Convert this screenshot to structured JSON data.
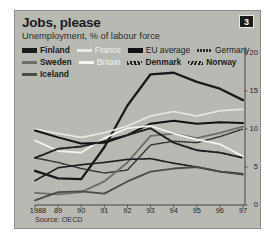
{
  "figure": {
    "title": "Jobs, please",
    "subtitle": "Unemployment, % of labour force",
    "badge": "3",
    "source": "Source: OECD",
    "panel_color": "#b9b9b4"
  },
  "legend": {
    "rows": [
      [
        {
          "label": "Finland",
          "style": "solid-thick-dark",
          "color": "#1a1a1a",
          "bold": true
        },
        {
          "label": "France",
          "style": "solid-light",
          "color": "#e9e9e4",
          "bold": false
        },
        {
          "label": "EU average",
          "style": "solid-thick-black",
          "color": "#111111",
          "bold": false
        },
        {
          "label": "Germany",
          "style": "dotted-dark",
          "color": "#2e2e2e",
          "bold": false
        }
      ],
      [
        {
          "label": "Sweden",
          "style": "solid-medium-grey",
          "color": "#6e6e68",
          "bold": true
        },
        {
          "label": "Britain",
          "style": "solid-white",
          "color": "#f4f4f1",
          "bold": false
        },
        {
          "label": "Denmark",
          "style": "dashed-slash-dark",
          "color": "#1f1f1f",
          "bold": true
        },
        {
          "label": "Norway",
          "style": "zigzag-dark",
          "color": "#1f1f1f",
          "bold": true
        }
      ],
      [
        {
          "label": "Iceland",
          "style": "solid-grey-dark",
          "color": "#4c4c47",
          "bold": true
        }
      ]
    ]
  },
  "chart_data": {
    "type": "line",
    "title": "Jobs, please",
    "subtitle": "Unemployment, % of labour force",
    "xlabel": "",
    "ylabel": "% of labour force",
    "x": [
      1988,
      1989,
      1990,
      1991,
      1992,
      1993,
      1994,
      1995,
      1996,
      1997
    ],
    "tick_labels": [
      "1988",
      "89",
      "90",
      "91",
      "92",
      "93",
      "94",
      "95",
      "96",
      "97"
    ],
    "ylim": [
      0,
      20
    ],
    "yticks": [
      0,
      5,
      10,
      15,
      20
    ],
    "ytick_side": "right",
    "grid": false,
    "legend_position": "top",
    "series": [
      {
        "name": "Finland",
        "color": "#1a1a1a",
        "width": 2.3,
        "dash": "none",
        "values": [
          4.5,
          3.5,
          3.4,
          7.6,
          13.1,
          17.2,
          17.4,
          16.2,
          15.3,
          13.8
        ]
      },
      {
        "name": "France",
        "color": "#e9e9e4",
        "width": 1.6,
        "dash": "none",
        "values": [
          10.0,
          9.4,
          8.9,
          9.5,
          10.4,
          11.7,
          12.3,
          11.7,
          12.4,
          12.6
        ]
      },
      {
        "name": "EU average",
        "color": "#111111",
        "width": 2.0,
        "dash": "none",
        "values": [
          9.8,
          8.9,
          8.1,
          8.2,
          9.2,
          10.7,
          11.1,
          10.7,
          10.9,
          10.8
        ]
      },
      {
        "name": "Germany",
        "color": "#2e2e2e",
        "width": 1.5,
        "dash": "1.4,1.4",
        "values": [
          6.2,
          5.6,
          4.8,
          4.2,
          4.6,
          7.9,
          8.4,
          8.2,
          9.0,
          10.0
        ]
      },
      {
        "name": "Sweden",
        "color": "#6e6e68",
        "width": 1.8,
        "dash": "none",
        "values": [
          1.6,
          1.4,
          1.7,
          3.1,
          5.6,
          9.1,
          9.4,
          8.8,
          9.5,
          10.3
        ]
      },
      {
        "name": "Britain",
        "color": "#f4f4f1",
        "width": 1.7,
        "dash": "none",
        "values": [
          8.5,
          7.1,
          6.9,
          8.8,
          10.1,
          10.4,
          9.4,
          8.6,
          8.0,
          6.4
        ]
      },
      {
        "name": "Denmark",
        "color": "#1f1f1f",
        "width": 1.9,
        "dash": "2.6,1.3",
        "values": [
          6.2,
          7.4,
          7.7,
          8.4,
          9.2,
          10.1,
          8.2,
          7.2,
          6.9,
          6.2
        ]
      },
      {
        "name": "Norway",
        "color": "#1f1f1f",
        "width": 1.7,
        "dash": "1.2,1.2",
        "values": [
          3.2,
          4.9,
          5.3,
          5.6,
          6.0,
          6.1,
          5.5,
          5.0,
          4.4,
          4.1
        ]
      },
      {
        "name": "Iceland",
        "color": "#4c4c47",
        "width": 1.8,
        "dash": "none",
        "values": [
          0.6,
          1.7,
          1.8,
          1.5,
          3.1,
          4.4,
          4.8,
          5.0,
          4.4,
          4.0
        ]
      }
    ]
  },
  "plot_geometry": {
    "left": 20,
    "right": 228,
    "top": 42,
    "bottom": 194
  }
}
